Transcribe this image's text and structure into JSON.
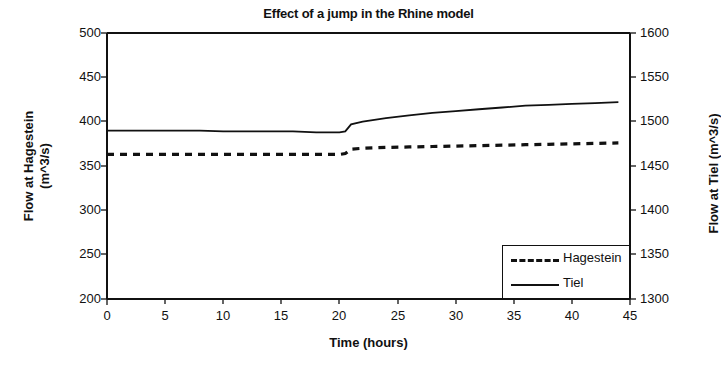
{
  "chart_data": {
    "type": "line",
    "title": "Effect of a jump in the Rhine model",
    "xlabel": "Time (hours)",
    "ylabel": "Flow at Hagestein (m^3/s)",
    "ylabel_line1": "Flow at Hagestein",
    "ylabel_line2": "(m^3/s)",
    "y2label": "Flow at Tiel (m^3/s)",
    "xlim": [
      0,
      45
    ],
    "ylim": [
      200,
      500
    ],
    "y2lim": [
      1300,
      1600
    ],
    "xticks": [
      "0",
      "5",
      "10",
      "15",
      "20",
      "25",
      "30",
      "35",
      "40",
      "45"
    ],
    "yticks": [
      "200",
      "250",
      "300",
      "350",
      "400",
      "450",
      "500"
    ],
    "y2ticks": [
      "1300",
      "1350",
      "1400",
      "1450",
      "1500",
      "1550",
      "1600"
    ],
    "grid": false,
    "legend_position": "lower-right",
    "line_color": "#111111",
    "series": [
      {
        "name": "Hagestein",
        "axis": "left",
        "style": "dashed",
        "x": [
          0,
          2,
          4,
          6,
          8,
          10,
          12,
          14,
          16,
          18,
          20,
          20.5,
          21,
          22,
          24,
          26,
          28,
          30,
          32,
          34,
          36,
          38,
          40,
          42,
          44
        ],
        "values": [
          363,
          363,
          363,
          363,
          363,
          363,
          363,
          363,
          363,
          363,
          363,
          364,
          369,
          370,
          371,
          371.5,
          372,
          372.5,
          373,
          373.5,
          374,
          374.5,
          375,
          375.5,
          376
        ]
      },
      {
        "name": "Tiel",
        "axis": "right",
        "style": "solid",
        "x": [
          0,
          2,
          4,
          6,
          8,
          10,
          12,
          14,
          16,
          18,
          20,
          20.5,
          21,
          22,
          24,
          26,
          28,
          30,
          32,
          34,
          36,
          38,
          40,
          42,
          44
        ],
        "values": [
          1490,
          1490,
          1490,
          1490,
          1490,
          1489,
          1489,
          1489,
          1489,
          1488,
          1488,
          1489,
          1497,
          1500,
          1504,
          1507,
          1510,
          1512,
          1514,
          1516,
          1518,
          1519,
          1520,
          1521,
          1522
        ]
      }
    ],
    "annotations": []
  },
  "legend": {
    "entries": [
      {
        "label": "Hagestein",
        "style": "dashed"
      },
      {
        "label": "Tiel",
        "style": "solid"
      }
    ]
  }
}
